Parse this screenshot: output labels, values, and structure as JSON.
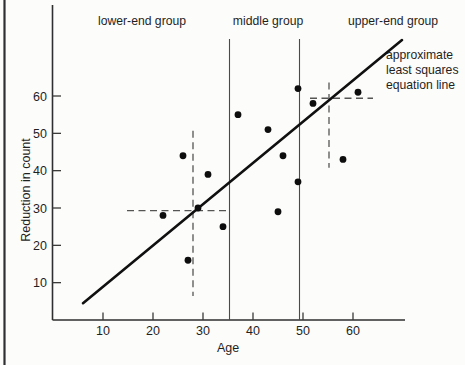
{
  "figure": {
    "background": "#fcfcfa",
    "ink_color": "#1f1f1f"
  },
  "chart_data": {
    "type": "scatter",
    "title": "",
    "xlabel": "Age",
    "ylabel": "Reduction in count",
    "x_ticks": [
      10,
      20,
      30,
      40,
      50,
      60
    ],
    "y_ticks": [
      10,
      20,
      30,
      40,
      50,
      60
    ],
    "xlim": [
      0,
      70
    ],
    "ylim": [
      0,
      84
    ],
    "grid": false,
    "points": [
      {
        "age": 22,
        "reduction": 28
      },
      {
        "age": 26,
        "reduction": 44
      },
      {
        "age": 27,
        "reduction": 16
      },
      {
        "age": 29,
        "reduction": 30
      },
      {
        "age": 31,
        "reduction": 39
      },
      {
        "age": 34,
        "reduction": 25
      },
      {
        "age": 37,
        "reduction": 55
      },
      {
        "age": 43,
        "reduction": 51
      },
      {
        "age": 45,
        "reduction": 29
      },
      {
        "age": 46,
        "reduction": 44
      },
      {
        "age": 49,
        "reduction": 37
      },
      {
        "age": 49,
        "reduction": 62
      },
      {
        "age": 52,
        "reduction": 58
      },
      {
        "age": 58,
        "reduction": 43
      },
      {
        "age": 61,
        "reduction": 61
      }
    ],
    "groups": {
      "labels": [
        "lower-end group",
        "middle group",
        "upper-end group"
      ],
      "boundary_ages": [
        35.3,
        49.3
      ]
    },
    "fit_line": {
      "label_lines": [
        "approximate",
        "least squares",
        "equation line"
      ],
      "from": {
        "age": 6.0,
        "reduction": 4.5
      },
      "to": {
        "age": 69.8,
        "reduction": 75.0
      }
    },
    "median_crosses": [
      {
        "center": {
          "age": 28,
          "reduction": 29.3
        },
        "h_age_span": [
          14.8,
          34.6
        ],
        "v_reduction_span": [
          6.4,
          50.7
        ]
      },
      {
        "center": {
          "age": 55.2,
          "reduction": 59.4
        },
        "h_age_span": [
          51.4,
          64.0
        ],
        "v_reduction_span": [
          40.8,
          63.6
        ]
      }
    ]
  }
}
